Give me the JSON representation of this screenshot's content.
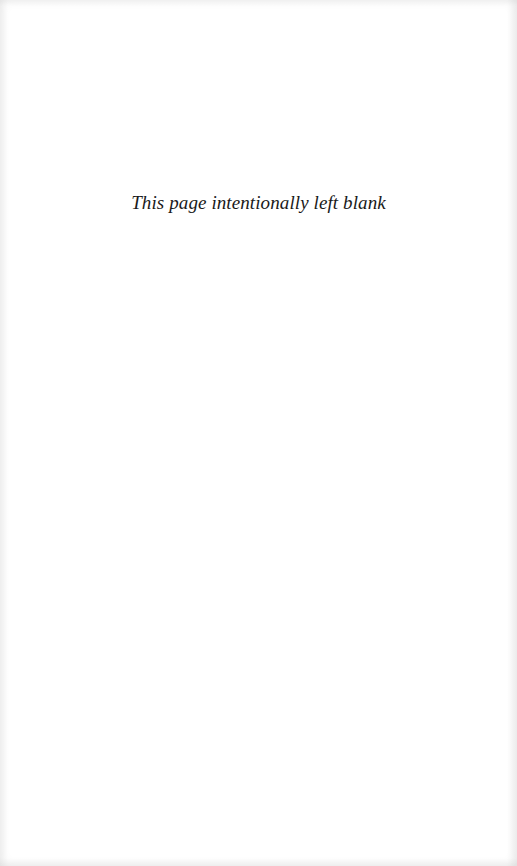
{
  "page": {
    "notice": "This page intentionally left blank",
    "background_color": "#ffffff",
    "text_color": "#1a1a1a"
  }
}
